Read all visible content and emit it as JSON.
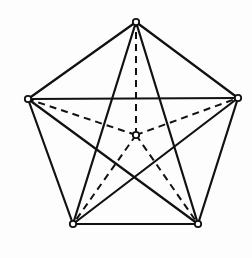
{
  "diagram": {
    "type": "graph",
    "colors": {
      "stroke": "#111111",
      "vertex_fill": "#ffffff",
      "background": "#fdfdfd"
    },
    "vertices": [
      {
        "id": "top",
        "x": 136,
        "y": 22
      },
      {
        "id": "left",
        "x": 28,
        "y": 99
      },
      {
        "id": "right",
        "x": 238,
        "y": 98
      },
      {
        "id": "bottom-left",
        "x": 73,
        "y": 224
      },
      {
        "id": "bottom-right",
        "x": 198,
        "y": 224
      },
      {
        "id": "center",
        "x": 136,
        "y": 135
      }
    ],
    "solid_edges": [
      [
        "top",
        "left"
      ],
      [
        "top",
        "right"
      ],
      [
        "left",
        "bottom-left"
      ],
      [
        "right",
        "bottom-right"
      ],
      [
        "bottom-left",
        "bottom-right"
      ],
      [
        "left",
        "right"
      ],
      [
        "top",
        "bottom-left"
      ],
      [
        "top",
        "bottom-right"
      ],
      [
        "left",
        "bottom-right"
      ],
      [
        "right",
        "bottom-left"
      ]
    ],
    "dashed_edges": [
      [
        "center",
        "top"
      ],
      [
        "center",
        "left"
      ],
      [
        "center",
        "right"
      ],
      [
        "center",
        "bottom-left"
      ],
      [
        "center",
        "bottom-right"
      ]
    ]
  }
}
